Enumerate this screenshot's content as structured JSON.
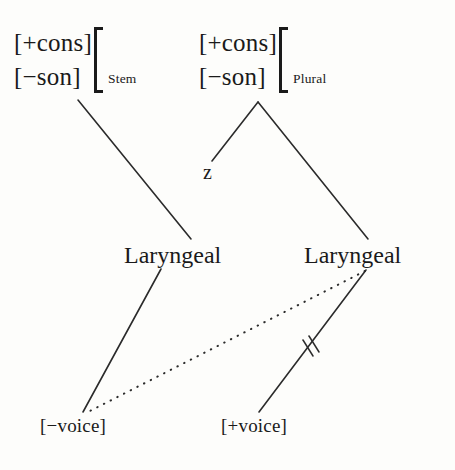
{
  "diagram": {
    "type": "autosegmental-phonology-tree",
    "background_color": "#fdfdfb",
    "line_color": "#2b2b2b",
    "nodes": {
      "stem_matrix": {
        "feature_1": "[+cons]",
        "feature_2": "[−son]",
        "subscript": "Stem"
      },
      "plural_matrix": {
        "feature_1": "[+cons]",
        "feature_2": "[−son]",
        "subscript": "Plural"
      },
      "segment_z": "z",
      "laryngeal_left": "Laryngeal",
      "laryngeal_right": "Laryngeal",
      "terminal_minus_voice": "[−voice]",
      "terminal_plus_voice": "[+voice]"
    },
    "annotations": {
      "delink_mark": "double-strike",
      "spread_line": "dotted"
    }
  }
}
